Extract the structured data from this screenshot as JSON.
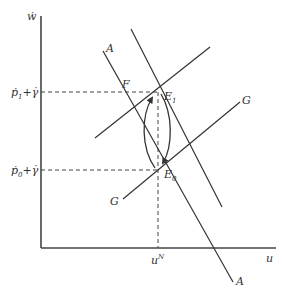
{
  "diagram": {
    "axes": {
      "y_label": "ẇ",
      "x_label": "u"
    },
    "levels": {
      "upper": {
        "main": "ṗ",
        "sub": "1",
        "rest": "+γ̇"
      },
      "lower": {
        "main": "ṗ",
        "sub": "0",
        "rest": "+γ̇"
      }
    },
    "x_marker": {
      "main": "u",
      "sup": "N"
    },
    "curves": {
      "A_left": {
        "label_top": "A",
        "label_bottom": "A"
      },
      "A_right": {
        "label": ""
      },
      "G_upper": {
        "label": "G"
      },
      "G_lower": {
        "label": "G"
      }
    },
    "points": {
      "F": "F",
      "E1": {
        "main": "E",
        "sub": "1"
      },
      "E0": {
        "main": "E",
        "sub": "0"
      }
    },
    "colors": {
      "ink": "#333333",
      "background": "#ffffff"
    }
  }
}
